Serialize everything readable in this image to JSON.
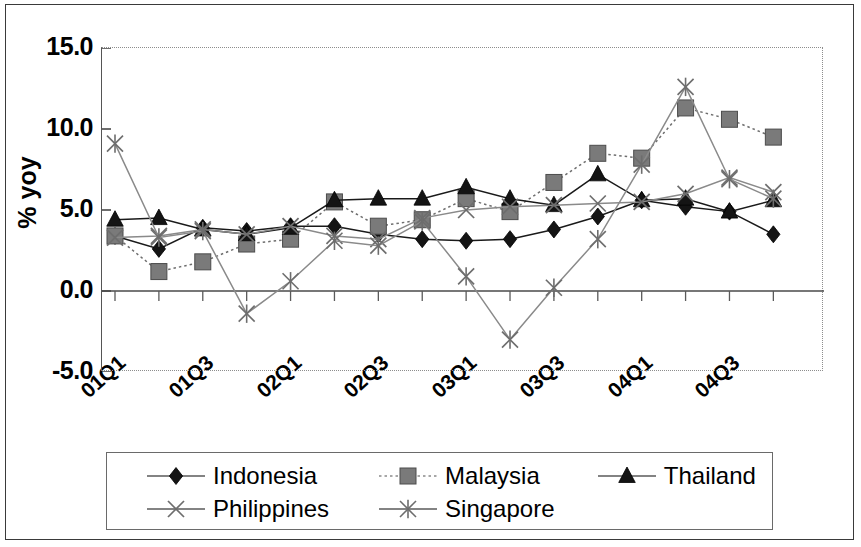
{
  "chart_data": {
    "type": "line",
    "title": "",
    "xlabel": "",
    "ylabel": "% yoy",
    "ylim": [
      -5.0,
      15.0
    ],
    "ytick_labels": [
      "15.0",
      "10.0",
      "5.0",
      "0.0",
      "-5.0"
    ],
    "ytick_values": [
      15.0,
      10.0,
      5.0,
      0.0,
      -5.0
    ],
    "grid": false,
    "legend_position": "bottom",
    "x": [
      "01Q1",
      "01Q2",
      "01Q3",
      "01Q4",
      "02Q1",
      "02Q2",
      "02Q3",
      "02Q4",
      "03Q1",
      "03Q2",
      "03Q3",
      "03Q4",
      "04Q1",
      "04Q2",
      "04Q3",
      "04Q4"
    ],
    "xtick_labels": [
      "01Q1",
      "01Q3",
      "02Q1",
      "02Q3",
      "03Q1",
      "03Q3",
      "04Q1",
      "04Q3"
    ],
    "xtick_indices": [
      0,
      2,
      4,
      6,
      8,
      10,
      12,
      14
    ],
    "series": [
      {
        "name": "Indonesia",
        "marker": "diamond",
        "line_style": "solid",
        "color": "#1a1a1a",
        "values": [
          3.4,
          2.6,
          3.9,
          3.7,
          4.0,
          4.0,
          3.5,
          3.2,
          3.1,
          3.2,
          3.8,
          4.6,
          5.6,
          5.2,
          4.9,
          3.5
        ]
      },
      {
        "name": "Malaysia",
        "marker": "square",
        "line_style": "dotted",
        "color": "#6e6e6e",
        "values": [
          3.4,
          1.2,
          1.8,
          2.9,
          3.2,
          5.5,
          4.0,
          4.4,
          5.7,
          4.9,
          6.7,
          8.5,
          8.2,
          11.3,
          10.6,
          9.5
        ]
      },
      {
        "name": "Thailand",
        "marker": "triangle",
        "line_style": "solid",
        "color": "#1a1a1a",
        "values": [
          4.4,
          4.5,
          3.8,
          3.5,
          3.9,
          5.6,
          5.7,
          5.7,
          6.4,
          5.7,
          5.3,
          7.2,
          5.6,
          5.7,
          4.9,
          5.6
        ]
      },
      {
        "name": "Philippines",
        "marker": "cross",
        "line_style": "solid",
        "color": "#8a8a8a",
        "values": [
          3.3,
          3.4,
          3.8,
          3.5,
          4.0,
          3.4,
          3.2,
          4.5,
          5.0,
          5.2,
          5.3,
          5.4,
          5.5,
          6.0,
          7.0,
          6.1
        ]
      },
      {
        "name": "Singapore",
        "marker": "asterisk",
        "line_style": "solid",
        "color": "#8a8a8a",
        "values": [
          9.1,
          3.3,
          3.7,
          -1.4,
          0.6,
          3.1,
          2.8,
          4.3,
          0.9,
          -3.0,
          0.2,
          3.2,
          7.8,
          12.6,
          6.9,
          5.7
        ]
      }
    ]
  },
  "legend": {
    "items": [
      {
        "label": "Indonesia",
        "marker": "diamond",
        "line_style": "solid"
      },
      {
        "label": "Malaysia",
        "marker": "square",
        "line_style": "dotted"
      },
      {
        "label": "Thailand",
        "marker": "triangle",
        "line_style": "solid"
      },
      {
        "label": "Philippines",
        "marker": "cross",
        "line_style": "solid"
      },
      {
        "label": "Singapore",
        "marker": "asterisk",
        "line_style": "solid"
      }
    ]
  }
}
